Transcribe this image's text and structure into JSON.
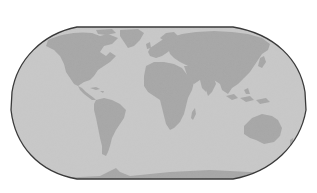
{
  "map": {
    "projection": "robinson-like world map",
    "style": "grayscale",
    "colors": {
      "background": "#ffffff",
      "ocean": "#c9c9c9",
      "land": "#a6a6a6",
      "outline": "#3a3a3a"
    },
    "regions": [
      "North America",
      "Greenland",
      "South America",
      "Europe",
      "Africa",
      "Asia",
      "Australia",
      "Antarctica",
      "Madagascar",
      "Indonesia",
      "Japan"
    ]
  }
}
